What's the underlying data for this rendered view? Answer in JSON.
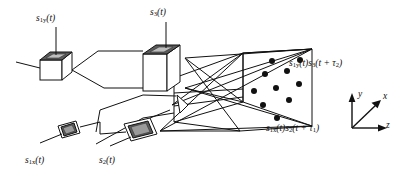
{
  "figure": {
    "type": "optical-schematic",
    "background_color": "#ffffff",
    "line_color": "#111111",
    "modulator_face_color": "#5a5a5a"
  },
  "labels": {
    "s1y": {
      "base": "s",
      "sub": "1y",
      "arg": "(t)"
    },
    "s3": {
      "base": "s",
      "sub": "3",
      "arg": "(t)"
    },
    "s1x": {
      "base": "s",
      "sub": "1x",
      "arg": "(t)"
    },
    "s2": {
      "base": "s",
      "sub": "2",
      "arg": "(t)"
    },
    "output_top": {
      "b1": "s",
      "s1": "1y",
      "a1": "(t)",
      "b2": "s",
      "s2": "3",
      "a2": "(t + τ",
      "s3": "2",
      "a3": ")"
    },
    "output_bottom": {
      "b1": "s",
      "s1": "1x",
      "a1": "(t)",
      "b2": "s",
      "s2": "2",
      "a2": "(t + τ",
      "s3": "1",
      "a3": ")"
    }
  },
  "axes": {
    "y": "y",
    "x": "x",
    "z": "z"
  },
  "components": [
    {
      "name": "slm-s1y",
      "kind": "cube-modulator",
      "input_signal": "s1y(t)"
    },
    {
      "name": "slm-s3",
      "kind": "tall-block-modulator",
      "input_signal": "s3(t)"
    },
    {
      "name": "slm-s1x",
      "kind": "small-tilted-modulator",
      "input_signal": "s1x(t)"
    },
    {
      "name": "slm-s2",
      "kind": "tilted-modulator",
      "input_signal": "s2(t)"
    },
    {
      "name": "crystal",
      "kind": "photorefractive-volume",
      "grating_dots": 10
    }
  ],
  "crystal_dots": [
    {
      "cx": 254,
      "cy": 91
    },
    {
      "cx": 265,
      "cy": 74
    },
    {
      "cx": 263,
      "cy": 105
    },
    {
      "cx": 276,
      "cy": 88
    },
    {
      "cx": 277,
      "cy": 118
    },
    {
      "cx": 287,
      "cy": 71
    },
    {
      "cx": 289,
      "cy": 100
    },
    {
      "cx": 299,
      "cy": 84
    },
    {
      "cx": 300,
      "cy": 60
    },
    {
      "cx": 272,
      "cy": 61
    }
  ]
}
